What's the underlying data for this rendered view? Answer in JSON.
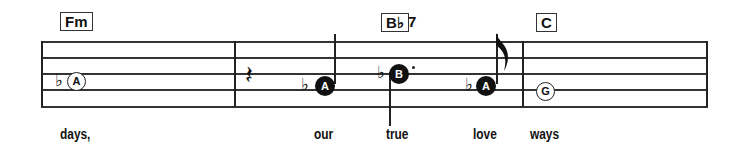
{
  "chords": [
    {
      "root": "Fm",
      "ext": ""
    },
    {
      "root": "B♭",
      "ext": "7"
    },
    {
      "root": "C",
      "ext": ""
    }
  ],
  "notes": [
    {
      "letter": "A",
      "accidental": "♭",
      "style": "open"
    },
    {
      "letter": "A",
      "accidental": "♭",
      "style": "filled"
    },
    {
      "letter": "B",
      "accidental": "♭",
      "style": "filled",
      "dotted": true
    },
    {
      "letter": "A",
      "accidental": "♭",
      "style": "filled"
    },
    {
      "letter": "G",
      "accidental": "",
      "style": "open"
    }
  ],
  "rest": "𝄽",
  "lyrics": [
    "days,",
    "our",
    "true",
    "love",
    "ways"
  ]
}
